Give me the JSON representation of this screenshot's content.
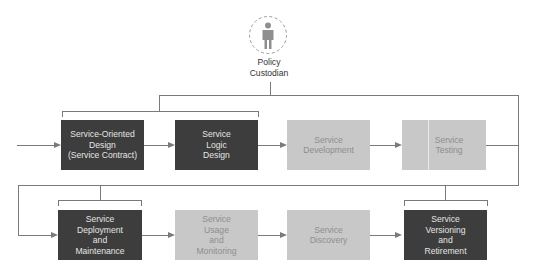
{
  "custodian": {
    "label_line1": "Policy",
    "label_line2": "Custodian",
    "icon": "person-icon"
  },
  "colors": {
    "dark_box": "#3d3d3d",
    "light_box": "#c8c8c8",
    "line": "#7a7a7a"
  },
  "top_row": [
    {
      "label": "Service-Oriented\nDesign\n(Service Contract)",
      "style": "dark"
    },
    {
      "label": "Service\nLogic\nDesign",
      "style": "dark"
    },
    {
      "label": "Service\nDevelopment",
      "style": "light"
    },
    {
      "label": "Service\nTesting",
      "style": "light"
    }
  ],
  "bottom_row": [
    {
      "label": "Service\nDeployment\nand\nMaintenance",
      "style": "dark"
    },
    {
      "label": "Service\nUsage\nand\nMonitoring",
      "style": "light"
    },
    {
      "label": "Service\nDiscovery",
      "style": "light"
    },
    {
      "label": "Service\nVersioning\nand\nRetirement",
      "style": "dark"
    }
  ]
}
